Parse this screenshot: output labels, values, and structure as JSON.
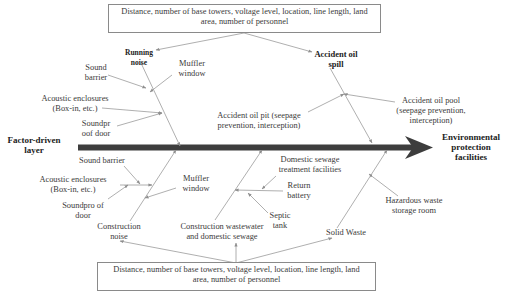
{
  "diagram": {
    "type": "fishbone",
    "left_label": "Factor-driven layer",
    "left_label_lines": [
      "Factor-driven",
      "layer"
    ],
    "right_label_lines": [
      "Environmental",
      "protection",
      "facilities"
    ],
    "top_box": {
      "lines": [
        "Distance, number of base towers, voltage level, location, line length, land",
        "area, number of personnel"
      ]
    },
    "bottom_box": {
      "lines": [
        "Distance, number of base towers, voltage level, location, line length, land",
        "area, number of personnel"
      ]
    },
    "upper_branches": [
      {
        "title_lines": [
          "Running",
          "noise"
        ],
        "causes": [
          {
            "lines": [
              "Sound",
              "barrier"
            ]
          },
          {
            "lines": [
              "Muffler",
              "window"
            ]
          },
          {
            "lines": [
              "Acoustic enclosures",
              "(Box-in, etc.)"
            ]
          },
          {
            "lines": [
              "Soundpr",
              "oof door"
            ]
          }
        ]
      },
      {
        "title_lines": [
          "Accident oil",
          "spill"
        ],
        "causes": [
          {
            "lines": [
              "Accident oil pit (seepage",
              "prevention, interception)"
            ]
          },
          {
            "lines": [
              "Accident oil pool",
              "(seepage prevention,",
              "interception)"
            ]
          }
        ]
      }
    ],
    "lower_branches": [
      {
        "title_lines": [
          "Construction",
          "noise"
        ],
        "causes": [
          {
            "lines": [
              "Sound barrier"
            ]
          },
          {
            "lines": [
              "Acoustic enclosures",
              "(Box-in, etc.)"
            ]
          },
          {
            "lines": [
              "Soundpro of",
              "door"
            ]
          },
          {
            "lines": [
              "Muffler",
              "window"
            ]
          }
        ]
      },
      {
        "title_lines": [
          "Construction wastewater",
          "and domestic sewage"
        ],
        "causes": [
          {
            "lines": [
              "Domestic sewage",
              "treatment facilities"
            ]
          },
          {
            "lines": [
              "Return",
              "battery"
            ]
          },
          {
            "lines": [
              "Septic",
              "tank"
            ]
          }
        ]
      },
      {
        "title_lines": [
          "Solid Waste"
        ],
        "causes": [
          {
            "lines": [
              "Hazardous waste",
              "storage room"
            ]
          }
        ]
      }
    ],
    "colors": {
      "spine": "#3d3d3d",
      "lines": "#9a9a9a",
      "text": "#3a3a3a",
      "box_border": "#8a8a8a"
    }
  }
}
